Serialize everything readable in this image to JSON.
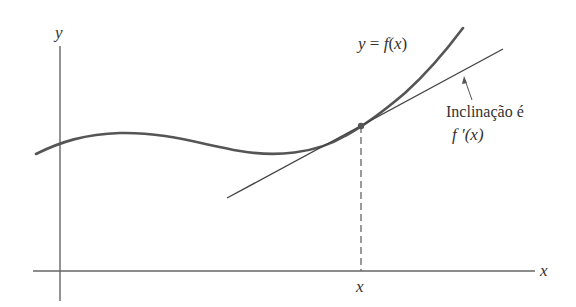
{
  "figure": {
    "axes": {
      "x_label": "x",
      "y_label": "y",
      "color": "#555555"
    },
    "curve": {
      "label": "y = f(x)",
      "color": "#555555"
    },
    "tangent": {
      "annotation_line1": "Inclinação é",
      "annotation_line2": "f ′(x)",
      "color": "#444444"
    },
    "point": {
      "label": "x",
      "color": "#555555"
    }
  }
}
